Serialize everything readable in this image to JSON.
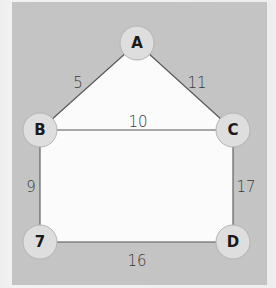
{
  "diagram": {
    "type": "weighted-graph",
    "colors": {
      "panel_background": "#c4c4c4",
      "page_background": "#eeeeee",
      "inner_face": "#fbfbfb",
      "node_fill": "#dedede",
      "node_stroke": "#b4b4b4",
      "edge": "#555555",
      "text": "#1a1a1a"
    },
    "nodes": [
      {
        "id": "A",
        "label": "A",
        "x": 137,
        "y": 43
      },
      {
        "id": "B",
        "label": "B",
        "x": 40,
        "y": 130
      },
      {
        "id": "C",
        "label": "C",
        "x": 233,
        "y": 130
      },
      {
        "id": "7",
        "label": "7",
        "x": 40,
        "y": 242
      },
      {
        "id": "D",
        "label": "D",
        "x": 233,
        "y": 242
      }
    ],
    "edges": [
      {
        "from": "A",
        "to": "B",
        "weight": "5",
        "label_x": 78,
        "label_y": 83
      },
      {
        "from": "A",
        "to": "C",
        "weight": "11",
        "label_x": 197,
        "label_y": 83
      },
      {
        "from": "B",
        "to": "C",
        "weight": "10",
        "label_x": 138,
        "label_y": 122
      },
      {
        "from": "B",
        "to": "7",
        "weight": "9",
        "label_x": 30,
        "label_y": 187
      },
      {
        "from": "C",
        "to": "D",
        "weight": "17",
        "label_x": 246,
        "label_y": 187
      },
      {
        "from": "7",
        "to": "D",
        "weight": "16",
        "label_x": 137,
        "label_y": 261
      }
    ]
  }
}
